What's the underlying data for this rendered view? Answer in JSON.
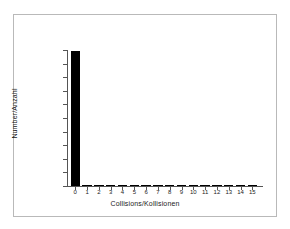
{
  "chart_data": {
    "type": "bar",
    "title": "",
    "xlabel": "Collisions/Kollisionen",
    "ylabel": "Number/Anzahl",
    "categories": [
      "0",
      "1",
      "2",
      "3",
      "4",
      "5",
      "6",
      "7",
      "8",
      "9",
      "10",
      "11",
      "12",
      "13",
      "14",
      "15"
    ],
    "values": [
      990000,
      4500,
      1200,
      600,
      400,
      300,
      250,
      200,
      150,
      120,
      100,
      80,
      60,
      50,
      40,
      30
    ],
    "xlim": [
      -0.7,
      15.9
    ],
    "ylim": [
      0,
      1000000
    ],
    "ytick_values": [
      0,
      100000,
      200000,
      300000,
      400000,
      500000,
      600000,
      700000,
      800000,
      900000,
      1000000
    ],
    "ytick_labels": [
      "0",
      "100000",
      "200000",
      "300000",
      "400000",
      "500000",
      "600000",
      "700000",
      "800000",
      "900000",
      "1000000"
    ],
    "xtick_labels": [
      "0",
      "1",
      "2",
      "3",
      "4",
      "5",
      "6",
      "7",
      "8",
      "9",
      "10",
      "11",
      "12",
      "13",
      "14",
      "15"
    ],
    "grid": false,
    "legend": null,
    "bar_color": "#000000",
    "axis_color": "#555555",
    "frame_color": "#b9b9b9",
    "background_color": "#ffffff"
  }
}
